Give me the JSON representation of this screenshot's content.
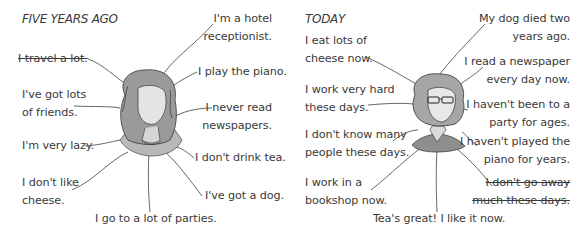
{
  "panels": [
    {
      "heading": "FIVE YEARS AGO",
      "statements": [
        {
          "lines": [
            "I'm a hotel",
            "receptionist."
          ],
          "crossed": false
        },
        {
          "lines": [
            "I travel a lot."
          ],
          "crossed": true
        },
        {
          "lines": [
            "I play the piano."
          ],
          "crossed": false
        },
        {
          "lines": [
            "I've got lots",
            "of friends."
          ],
          "crossed": false
        },
        {
          "lines": [
            "I never read",
            "newspapers."
          ],
          "crossed": false
        },
        {
          "lines": [
            "I'm very lazy."
          ],
          "crossed": false
        },
        {
          "lines": [
            "I don't drink tea."
          ],
          "crossed": false
        },
        {
          "lines": [
            "I don't like",
            "cheese."
          ],
          "crossed": false
        },
        {
          "lines": [
            "I've got a dog."
          ],
          "crossed": false
        },
        {
          "lines": [
            "I go to a lot of parties."
          ],
          "crossed": false
        }
      ],
      "illustration": "woman-curly-hair-portrait"
    },
    {
      "heading": "TODAY",
      "statements": [
        {
          "lines": [
            "My dog died two",
            "years ago."
          ],
          "crossed": false
        },
        {
          "lines": [
            "I eat lots of",
            "cheese now."
          ],
          "crossed": false
        },
        {
          "lines": [
            "I read a newspaper",
            "every day now."
          ],
          "crossed": false
        },
        {
          "lines": [
            "I work very hard",
            "these days."
          ],
          "crossed": false
        },
        {
          "lines": [
            "I haven't been to a",
            "party for ages."
          ],
          "crossed": false
        },
        {
          "lines": [
            "I don't know many",
            "people these days."
          ],
          "crossed": false
        },
        {
          "lines": [
            "I haven't played the",
            "piano for years."
          ],
          "crossed": false
        },
        {
          "lines": [
            "I work in a",
            "bookshop now."
          ],
          "crossed": false
        },
        {
          "lines": [
            "I don't go away",
            "much these days."
          ],
          "crossed": true
        },
        {
          "lines": [
            "Tea's great!  I like it now."
          ],
          "crossed": false
        }
      ],
      "illustration": "woman-with-glasses-portrait"
    }
  ],
  "colors": {
    "text": "#3a3a3a",
    "lines": "#555555",
    "shade": "#a8a8a8"
  }
}
